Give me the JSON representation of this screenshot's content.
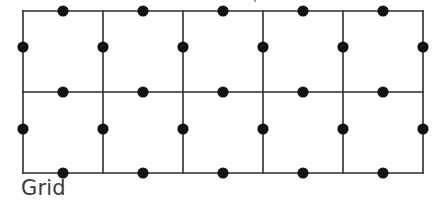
{
  "figure": {
    "caption": "Grid",
    "clipped_top_text": ",",
    "stroke_color": "#2b2b2b",
    "dot_color": "#141414",
    "background_color": "#ffffff",
    "caption_color": "#3b3b3b"
  },
  "chart_data": {
    "type": "diagram",
    "title": "Grid",
    "grid": {
      "columns": 5,
      "rows": 2,
      "origin_x": 23,
      "origin_y": 11,
      "cell_width": 80,
      "cell_height": 81,
      "total_width": 400,
      "total_height": 162,
      "vertical_line_x": [
        23,
        103,
        183,
        263,
        343,
        423
      ],
      "horizontal_line_y": [
        11,
        92,
        173
      ],
      "line_width": 1.6,
      "line_color": "#2b2b2b"
    },
    "dots": {
      "count": 27,
      "radius": 5.6,
      "color": "#141414",
      "on_horizontal_lines": {
        "count": 15,
        "x": [
          63,
          143,
          223,
          303,
          383
        ],
        "y": [
          11,
          92,
          173
        ]
      },
      "on_vertical_lines": {
        "count": 12,
        "x": [
          23,
          103,
          183,
          263,
          343,
          423
        ],
        "y": [
          47,
          129
        ]
      }
    },
    "xlabel": "",
    "ylabel": "",
    "legend": [],
    "grid_visible": true
  }
}
